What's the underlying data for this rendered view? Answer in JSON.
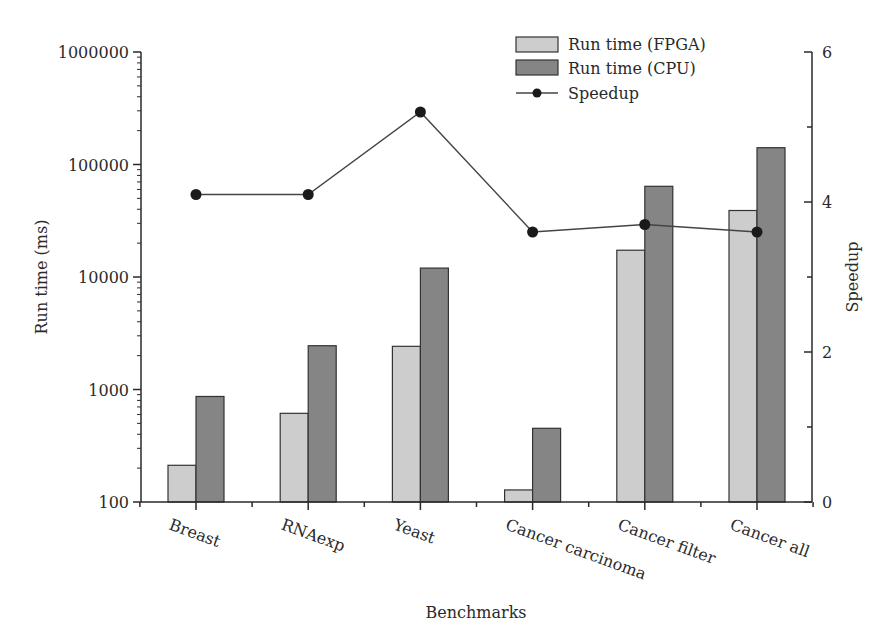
{
  "chart_data": {
    "type": "bar",
    "title": "",
    "xlabel": "Benchmarks",
    "ylabel": "Run time (ms)",
    "y2label": "Speedup",
    "yscale": "log",
    "ylim": [
      100,
      1000000
    ],
    "y2lim": [
      0,
      6
    ],
    "yticks": [
      "100",
      "1000",
      "10000",
      "100000",
      "1000000"
    ],
    "y2ticks": [
      "0",
      "2",
      "4",
      "6"
    ],
    "categories": [
      "Breast",
      "RNAexp",
      "Yeast",
      "Cancer carcinoma",
      "Cancer filter",
      "Cancer all"
    ],
    "series": [
      {
        "name": "Run time (FPGA)",
        "type": "bar",
        "axis": "left",
        "color": "#cdcdcd",
        "values": [
          212,
          614,
          2420,
          128,
          17300,
          39000
        ]
      },
      {
        "name": "Run time (CPU)",
        "type": "bar",
        "axis": "left",
        "color": "#858585",
        "values": [
          867,
          2450,
          12000,
          452,
          64000,
          141000
        ]
      },
      {
        "name": "Speedup",
        "type": "line",
        "axis": "right",
        "color": "#1a1a1a",
        "values": [
          4.1,
          4.1,
          5.2,
          3.6,
          3.7,
          3.6
        ]
      }
    ],
    "legend": {
      "position": "top-right",
      "entries": [
        "Run time (FPGA)",
        "Run time (CPU)",
        "Speedup"
      ]
    },
    "grid": false
  }
}
